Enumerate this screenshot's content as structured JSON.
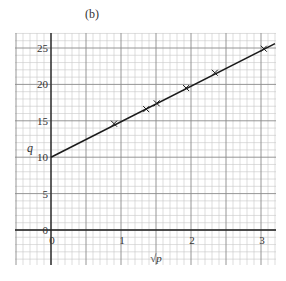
{
  "panel_label": "(b)",
  "chart_data": {
    "type": "line",
    "title": "(b)",
    "xlabel": "√p",
    "ylabel": "q",
    "xlim": [
      -0.5,
      3.2
    ],
    "ylim": [
      -5,
      27
    ],
    "x_ticks": [
      0,
      1,
      2,
      3
    ],
    "x_tick_labels": [
      "0",
      "1",
      "2",
      "3"
    ],
    "y_ticks": [
      0,
      5,
      10,
      15,
      20,
      25
    ],
    "y_tick_labels": [
      "0",
      "5",
      "10",
      "15",
      "20",
      "25"
    ],
    "grid": true,
    "legend": null,
    "series": [
      {
        "name": "measured points",
        "marker": "x",
        "x": [
          0.9,
          1.36,
          1.51,
          1.93,
          2.34,
          3.04
        ],
        "y": [
          14.6,
          16.6,
          17.4,
          19.5,
          21.6,
          24.9
        ]
      },
      {
        "name": "best-fit line",
        "marker": "none",
        "x": [
          0,
          3.2
        ],
        "y": [
          10,
          25.6
        ]
      }
    ]
  },
  "colors": {
    "grid_minor": "#c8c8c8",
    "grid_major": "#8a8a8a",
    "axis": "#222222",
    "line": "#1a1a1a"
  }
}
